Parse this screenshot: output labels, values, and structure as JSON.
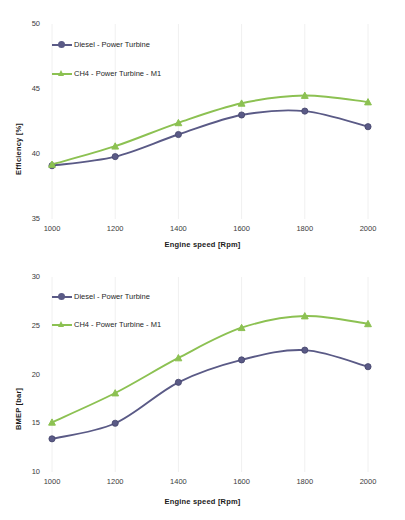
{
  "figure": {
    "background": "#ffffff",
    "series_colors": {
      "diesel": "#5a5a86",
      "ch4": "#8cc152"
    }
  },
  "chart_data": [
    {
      "type": "line",
      "id": "efficiency",
      "title": "",
      "xlabel": "Engine speed [Rpm]",
      "ylabel": "Efficiency [%]",
      "x": [
        1000,
        1200,
        1400,
        1600,
        1800,
        2000
      ],
      "xticklabels": [
        "1000",
        "1200",
        "1400",
        "1600",
        "1800",
        "2000"
      ],
      "yticklabels": [
        "35",
        "40",
        "45",
        "50"
      ],
      "yticks": [
        35,
        40,
        45,
        50
      ],
      "xlim": [
        1000,
        2000
      ],
      "ylim": [
        35,
        50
      ],
      "grid": false,
      "legend_position": "upper left",
      "series": [
        {
          "name": "Diesel - Power Turbine",
          "color": "#5a5a86",
          "marker": "circle",
          "values": [
            39.1,
            39.8,
            41.5,
            43.0,
            43.3,
            42.1
          ]
        },
        {
          "name": "CH4 - Power Turbine - M1",
          "color": "#8cc152",
          "marker": "triangle",
          "values": [
            39.2,
            40.6,
            42.4,
            43.9,
            44.5,
            44.0
          ]
        }
      ]
    },
    {
      "type": "line",
      "id": "bmep",
      "title": "",
      "xlabel": "Engine speed [Rpm]",
      "ylabel": "BMEP [bar]",
      "x": [
        1000,
        1200,
        1400,
        1600,
        1800,
        2000
      ],
      "xticklabels": [
        "1000",
        "1200",
        "1400",
        "1600",
        "1800",
        "2000"
      ],
      "yticklabels": [
        "10",
        "15",
        "20",
        "25",
        "30"
      ],
      "yticks": [
        10,
        15,
        20,
        25,
        30
      ],
      "xlim": [
        1000,
        2000
      ],
      "ylim": [
        10,
        30
      ],
      "grid": false,
      "legend_position": "upper left",
      "series": [
        {
          "name": "Diesel - Power Turbine",
          "color": "#5a5a86",
          "marker": "circle",
          "values": [
            13.4,
            15.0,
            19.2,
            21.5,
            22.5,
            20.8
          ]
        },
        {
          "name": "CH4 - Power Turbine - M1",
          "color": "#8cc152",
          "marker": "triangle",
          "values": [
            15.1,
            18.1,
            21.7,
            24.8,
            26.0,
            25.2
          ]
        }
      ]
    }
  ]
}
